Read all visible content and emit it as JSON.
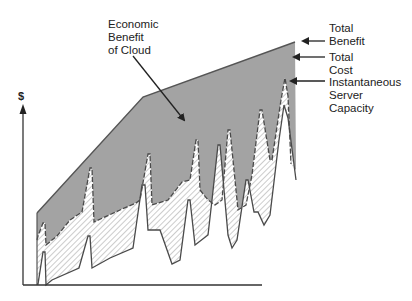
{
  "diagram": {
    "y_axis_label": "$",
    "annotations": {
      "economic_benefit": [
        "Economic",
        "Benefit",
        "of Cloud"
      ],
      "total_benefit": [
        "Total",
        "Benefit"
      ],
      "total_cost": [
        "Total",
        "Cost"
      ],
      "server_capacity": [
        "Instantaneous",
        "Server",
        "Capacity"
      ]
    },
    "colors": {
      "benefit_fill": "#a3a3a3",
      "line": "#4a4a4a",
      "hatch": "#8a8a8a",
      "background": "#ffffff",
      "text": "#222222"
    }
  }
}
